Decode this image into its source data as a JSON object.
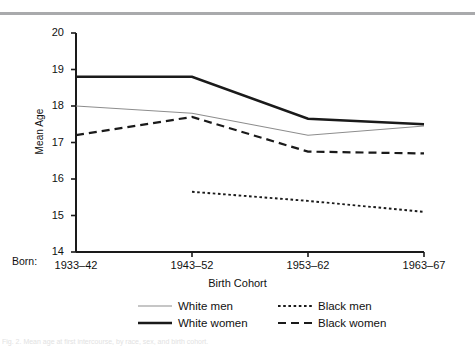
{
  "figure": {
    "top_rule_color": "#a9aaac",
    "bottom_caption": "Fig. 2. Mean age at first intercourse, by race, sex, and birth cohort."
  },
  "chart_data": {
    "type": "line",
    "title": "",
    "xlabel": "Birth Cohort",
    "ylabel": "Mean Age",
    "x_prefix_label": "Born:",
    "categories": [
      "1933–42",
      "1943–52",
      "1953–62",
      "1963–67"
    ],
    "ylim": [
      14,
      20
    ],
    "yticks": [
      14,
      15,
      16,
      17,
      18,
      19,
      20
    ],
    "ytick_labels": [
      "14",
      "15",
      "16",
      "17",
      "18",
      "19",
      "20"
    ],
    "grid": false,
    "legend_position": "below",
    "series": [
      {
        "name": "White men",
        "style": "solid-thin",
        "color": "#8d8d8d",
        "values": [
          18.0,
          17.8,
          17.2,
          17.45
        ]
      },
      {
        "name": "White women",
        "style": "solid-thick",
        "color": "#1a1a1a",
        "values": [
          18.8,
          18.8,
          17.65,
          17.5
        ]
      },
      {
        "name": "Black men",
        "style": "dotted",
        "color": "#1a1a1a",
        "values": [
          null,
          15.65,
          15.4,
          15.1
        ]
      },
      {
        "name": "Black women",
        "style": "dashed",
        "color": "#1a1a1a",
        "values": [
          17.2,
          17.7,
          16.75,
          16.7
        ]
      }
    ]
  }
}
